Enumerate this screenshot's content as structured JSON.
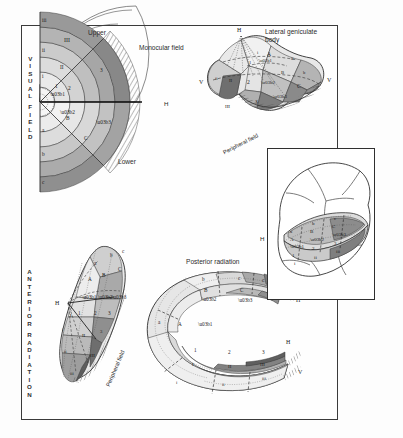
{
  "figure": {
    "domain": "anatomical-diagram",
    "background": "#ffffff",
    "frame_color": "#3a3a3a"
  },
  "panels": {
    "visual_field": {
      "side_caption": [
        "V",
        "I",
        "S",
        "U",
        "A",
        "L",
        "",
        "F",
        "I",
        "E",
        "L",
        "D"
      ],
      "side_caption_text": "VISUAL FIELD",
      "upper_label": "Upper",
      "lower_label": "Lower",
      "monocular_label": "Monocular field",
      "horizontal_marker": "H",
      "sector_letters_outer": [
        "a",
        "b",
        "c"
      ],
      "sector_letters_mid": [
        "A",
        "B",
        "C"
      ],
      "sector_letters_greek": [
        "α",
        "β",
        "γ"
      ],
      "ring_numerals_upper_roman_small": [
        "i",
        "ii",
        "iii"
      ],
      "ring_numerals_upper_roman_large": [
        "I",
        "II",
        "III"
      ],
      "ring_numerals_arabic": [
        "1",
        "2",
        "3"
      ]
    },
    "lateral_geniculate_body": {
      "title": "Lateral geniculate body",
      "peripheral_label": "Peripheral field",
      "apex_marker": "H",
      "left_marker": "V",
      "right_marker": "V",
      "letters": [
        "A",
        "B",
        "C"
      ],
      "greek": [
        "α",
        "β",
        "γ"
      ],
      "small_roman": [
        "i",
        "ii",
        "iii"
      ],
      "large_roman": [
        "I",
        "II",
        "III"
      ],
      "arabic": [
        "1",
        "2",
        "3"
      ],
      "lower_letters": [
        "a",
        "b",
        "c"
      ]
    },
    "anterior_radiation": {
      "side_caption": [
        "A",
        "N",
        "T",
        "E",
        "R",
        "I",
        "O",
        "R",
        "",
        "R",
        "A",
        "D",
        "I",
        "A",
        "T",
        "I",
        "O",
        "N"
      ],
      "side_caption_text": "ANTERIOR RADIATION",
      "peripheral_label": "Peripheral field",
      "marker": "H",
      "letters": [
        "a",
        "b",
        "c"
      ],
      "capitals": [
        "A",
        "B",
        "C"
      ],
      "greek": [
        "α",
        "β",
        "γ"
      ],
      "arabic": [
        "1",
        "2",
        "3"
      ],
      "small_roman": [
        "i",
        "ii",
        "iii"
      ],
      "large_roman": [
        "I",
        "II",
        "III"
      ]
    },
    "posterior_radiation": {
      "title": "Posterior radiation",
      "markers": [
        "V",
        "H",
        "H",
        "V"
      ],
      "letters": [
        "a",
        "b",
        "c"
      ],
      "capitals": [
        "A",
        "B",
        "C"
      ],
      "greek": [
        "α",
        "β",
        "γ"
      ],
      "arabic": [
        "1",
        "2",
        "3"
      ],
      "small_roman": [
        "i",
        "ii",
        "iii"
      ],
      "large_roman": [
        "I",
        "II",
        "III"
      ]
    },
    "visual_cortex": {
      "side_caption": [
        "V",
        "I",
        "S",
        "U",
        "A",
        "L",
        "",
        "C",
        "O",
        "R",
        "T",
        "E",
        "X"
      ],
      "side_caption_text": "VISUAL CORTEX",
      "marker": "H",
      "letters": [
        "a",
        "b",
        "c"
      ],
      "capitals": [
        "A",
        "B",
        "C"
      ],
      "greek": [
        "α",
        "β",
        "γ"
      ],
      "arabic": [
        "1",
        "2",
        "3"
      ],
      "small_roman": [
        "i",
        "ii",
        "iii"
      ],
      "large_roman": [
        "I",
        "II",
        "III"
      ]
    }
  }
}
